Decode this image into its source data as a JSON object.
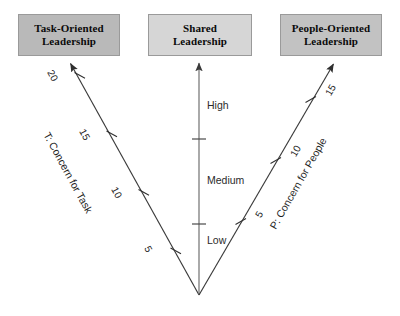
{
  "diagram": {
    "headers": [
      {
        "id": "task",
        "line1": "Task-Oriented",
        "line2": "Leadership",
        "color": "#b9b9b9"
      },
      {
        "id": "shared",
        "line1": "Shared",
        "line2": "Leadership",
        "color": "#d6d6d6"
      },
      {
        "id": "people",
        "line1": "People-Oriented",
        "line2": "Leadership",
        "color": "#c2c2c2"
      }
    ],
    "axes": {
      "left": {
        "title": "T: Concern for Task",
        "ticks": [
          "20",
          "15",
          "10",
          "5"
        ],
        "arrow": "up-left-arrow"
      },
      "center": {
        "levels": [
          "High",
          "Medium",
          "Low"
        ],
        "arrow": "up-arrow"
      },
      "right": {
        "title": "P: Concern for People",
        "ticks": [
          "15",
          "10",
          "5"
        ],
        "arrow": "up-right-arrow"
      }
    },
    "colors": {
      "line": "#3a3a3a",
      "center_line": "#6b6b6b",
      "text": "#1d1d1d",
      "background": "#ffffff"
    }
  }
}
